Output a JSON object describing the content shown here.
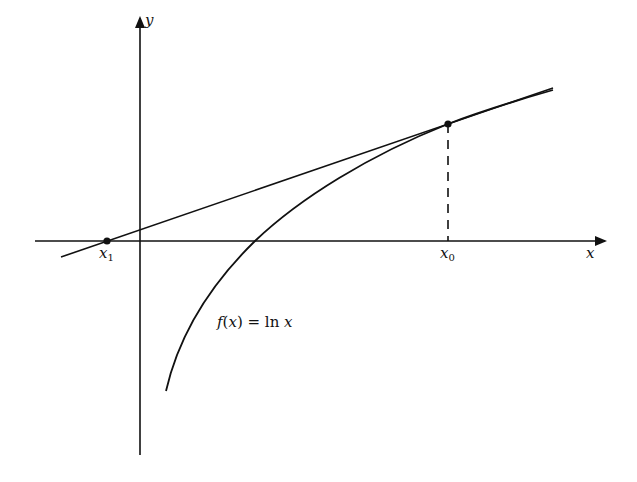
{
  "diagram": {
    "axes": {
      "x_label": "x",
      "y_label": "y"
    },
    "points": [
      {
        "name": "x0",
        "label_base": "x",
        "label_sub": "0"
      },
      {
        "name": "x1",
        "label_base": "x",
        "label_sub": "1"
      }
    ],
    "function_label": {
      "f": "f",
      "arg": "(x)",
      "equals": " = ",
      "ln": "ln",
      "var": " x"
    },
    "colors": {
      "stroke": "#111111",
      "background": "#ffffff"
    }
  }
}
